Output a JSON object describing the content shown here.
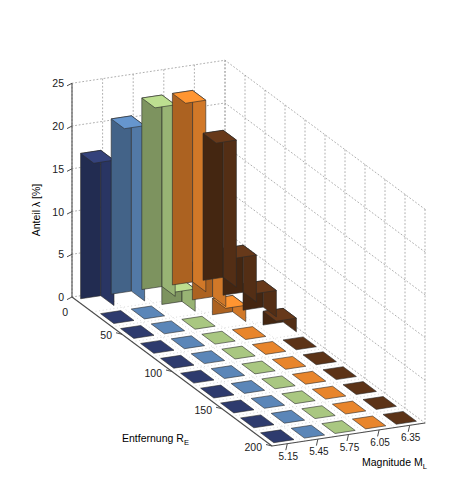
{
  "chart_data": {
    "type": "bar",
    "render": "3d-bar",
    "title": "",
    "subtitle": "",
    "xlabel": "Entfernung R",
    "xlabel_sub": "E",
    "ylabel": "Magnitude M",
    "ylabel_sub": "L",
    "zlabel": "Anteil λ [%]",
    "x_axis": {
      "name": "Entfernung R_E",
      "ticks": [
        "50",
        "100",
        "150",
        "200"
      ],
      "tick_values": [
        50,
        100,
        150,
        200
      ],
      "origin_label": "0",
      "range": [
        0,
        200
      ]
    },
    "y_axis": {
      "name": "Magnitude M_L",
      "ticks": [
        "5.15",
        "5.45",
        "5.75",
        "6.05",
        "6.35"
      ],
      "tick_values": [
        5.15,
        5.45,
        5.75,
        6.05,
        6.35
      ],
      "range": [
        5.0,
        6.5
      ]
    },
    "z_axis": {
      "name": "Anteil λ [%]",
      "ticks": [
        "0",
        "5",
        "10",
        "15",
        "20",
        "25"
      ],
      "tick_values": [
        0,
        5,
        10,
        15,
        20,
        25
      ],
      "zlim": [
        0,
        25
      ],
      "grid": true,
      "grid_style": "dotted"
    },
    "legend": {
      "visible": false,
      "position": "none"
    },
    "series": [
      {
        "name": "5.15",
        "color": "#2e3b6e",
        "values": [
          17.0,
          0.0,
          0.0,
          0.0,
          0.0,
          0.0,
          0.0,
          0.0,
          0.0,
          0.0
        ]
      },
      {
        "name": "5.45",
        "color": "#5b86b8",
        "values": [
          20.5,
          0.0,
          0.0,
          0.0,
          0.0,
          0.0,
          0.0,
          0.0,
          0.0,
          0.0
        ]
      },
      {
        "name": "5.75",
        "color": "#a9c781",
        "values": [
          22.4,
          2.6,
          0.0,
          0.0,
          0.0,
          0.0,
          0.0,
          0.0,
          0.0,
          0.0
        ]
      },
      {
        "name": "6.05",
        "color": "#e8852c",
        "values": [
          22.4,
          4.4,
          1.9,
          0.0,
          0.0,
          0.0,
          0.0,
          0.0,
          0.0,
          0.0
        ]
      },
      {
        "name": "6.35",
        "color": "#5c3317",
        "values": [
          17.2,
          5.5,
          3.1,
          1.6,
          0.0,
          0.0,
          0.0,
          0.0,
          0.0,
          0.0
        ]
      }
    ],
    "categories_x": [
      20,
      40,
      60,
      80,
      100,
      120,
      140,
      160,
      180,
      200
    ],
    "colors": {
      "bar_1": "#2e3b6e",
      "bar_2": "#5b86b8",
      "bar_3": "#a9c781",
      "bar_4": "#e8852c",
      "bar_5": "#5c3317",
      "grid": "#9a9a9a",
      "axis": "#4d4d4d",
      "background": "#ffffff"
    }
  },
  "labels": {
    "z_axis_title": "Anteil λ [%]",
    "x_axis_title": "Entfernung R",
    "x_axis_title_sub": "E",
    "y_axis_title": "Magnitude M",
    "y_axis_title_sub": "L",
    "z_ticks": [
      "25",
      "20",
      "15",
      "10",
      "5",
      "0"
    ],
    "x_origin": "0",
    "x_ticks": [
      "50",
      "100",
      "150",
      "200"
    ],
    "y_ticks": [
      "5.15",
      "5.45",
      "5.75",
      "6.05",
      "6.35"
    ]
  }
}
